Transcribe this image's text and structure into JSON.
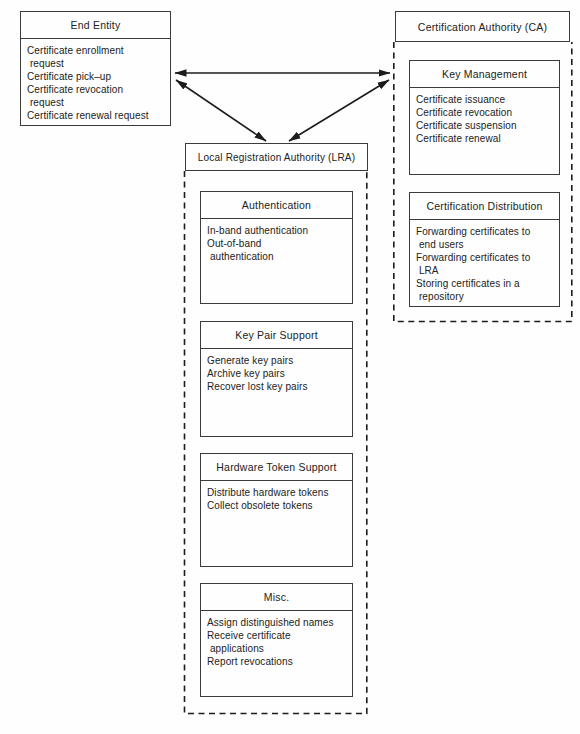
{
  "colors": {
    "ink": "#222222",
    "line": "#1c1c1c",
    "background": "#fefefe"
  },
  "end_entity": {
    "title": "End Entity",
    "items": [
      "Certificate enrollment\n request",
      "Certificate pick–up",
      "Certificate revocation\n request",
      "Certificate renewal request"
    ]
  },
  "ca": {
    "title": "Certification Authority (CA)",
    "modules": [
      {
        "title": "Key Management",
        "items": [
          "Certificate issuance",
          "Certificate revocation",
          "Certificate suspension",
          "Certificate renewal"
        ]
      },
      {
        "title": "Certification Distribution",
        "items": [
          "Forwarding certificates to\n end users",
          "Forwarding certificates to\n LRA",
          "Storing certificates in a\n repository"
        ]
      }
    ]
  },
  "lra": {
    "title": "Local Registration Authority (LRA)",
    "modules": [
      {
        "title": "Authentication",
        "items": [
          "In-band authentication",
          "Out-of-band\n authentication"
        ]
      },
      {
        "title": "Key Pair Support",
        "items": [
          "Generate key pairs",
          "Archive key pairs",
          "Recover lost key pairs"
        ]
      },
      {
        "title": "Hardware Token Support",
        "items": [
          "Distribute hardware tokens",
          "Collect obsolete tokens"
        ]
      },
      {
        "title": "Misc.",
        "items": [
          "Assign distinguished names",
          "Receive certificate\n applications",
          "Report revocations"
        ]
      }
    ]
  },
  "connections": [
    {
      "from": "End Entity",
      "to": "Certification Authority (CA)",
      "style": "double-headed-arrow"
    },
    {
      "from": "End Entity",
      "to": "Local Registration Authority (LRA)",
      "style": "double-headed-arrow"
    },
    {
      "from": "Certification Authority (CA)",
      "to": "Local Registration Authority (LRA)",
      "style": "double-headed-arrow"
    }
  ]
}
